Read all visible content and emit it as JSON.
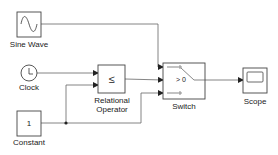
{
  "diagram": {
    "type": "simulink-model",
    "blocks": [
      {
        "id": "sine",
        "label": "Sine Wave",
        "icon": "sine-wave-icon"
      },
      {
        "id": "clock",
        "label": "Clock",
        "icon": "clock-icon"
      },
      {
        "id": "constant",
        "label": "Constant",
        "value": "1"
      },
      {
        "id": "relop",
        "label_line1": "Relational",
        "label_line2": "Operator",
        "symbol": "≤"
      },
      {
        "id": "switch",
        "label": "Switch",
        "criteria": "> 0"
      },
      {
        "id": "scope",
        "label": "Scope",
        "icon": "scope-icon"
      }
    ],
    "connections": [
      {
        "from": "Sine Wave",
        "to": "Switch.in1"
      },
      {
        "from": "Clock",
        "to": "Relational Operator.in1"
      },
      {
        "from": "Constant",
        "to": "Relational Operator.in2"
      },
      {
        "from": "Relational Operator",
        "to": "Switch.in2"
      },
      {
        "from": "Constant",
        "to": "Switch.in3"
      },
      {
        "from": "Switch",
        "to": "Scope"
      }
    ],
    "colors": {
      "line": "#555555",
      "block_border": "#444444",
      "background": "#ffffff"
    }
  }
}
